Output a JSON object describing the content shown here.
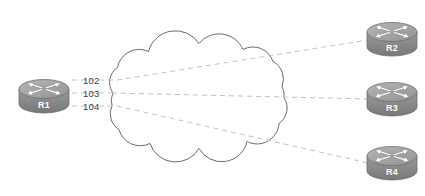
{
  "diagram": {
    "type": "network-topology",
    "title": "",
    "background_color": "#ffffff",
    "cloud": {
      "name": "network-cloud",
      "stroke_color": "#6b6b6b",
      "fill_color": "#ffffff"
    },
    "link_style": {
      "stroke_color": "#bdbdbd",
      "dash": "5,4",
      "width": 1
    },
    "routers": [
      {
        "id": "r1",
        "label": "R1",
        "position": "left",
        "body_color": "#8e8e8e",
        "top_color": "#a8a8a8"
      },
      {
        "id": "r2",
        "label": "R2",
        "position": "right-top",
        "body_color": "#8e8e8e",
        "top_color": "#a8a8a8"
      },
      {
        "id": "r3",
        "label": "R3",
        "position": "right-middle",
        "body_color": "#8e8e8e",
        "top_color": "#a8a8a8"
      },
      {
        "id": "r4",
        "label": "R4",
        "position": "right-bottom",
        "body_color": "#8e8e8e",
        "top_color": "#a8a8a8"
      }
    ],
    "link_labels": [
      {
        "id": "link-102",
        "text": "102",
        "from": "R1",
        "to": "R2"
      },
      {
        "id": "link-103",
        "text": "103",
        "from": "R1",
        "to": "R3"
      },
      {
        "id": "link-104",
        "text": "104",
        "from": "R1",
        "to": "R4"
      }
    ]
  }
}
